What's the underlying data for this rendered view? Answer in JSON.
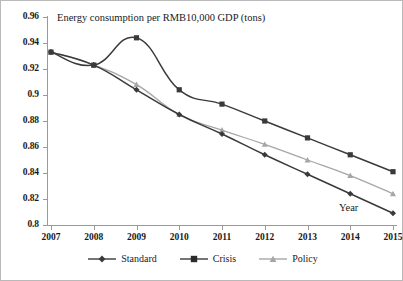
{
  "chart_data": {
    "type": "line",
    "title": "Energy consumption per RMB10,000 GDP (tons)",
    "xlabel": "Year",
    "ylabel": "",
    "categories": [
      "2007",
      "2008",
      "2009",
      "2010",
      "2011",
      "2012",
      "2013",
      "2014",
      "2015"
    ],
    "ylim": [
      0.8,
      0.96
    ],
    "yticks": [
      "0.96",
      "0.94",
      "0.92",
      "0.9",
      "0.88",
      "0.86",
      "0.84",
      "0.82",
      "0.8"
    ],
    "ytick_values": [
      0.96,
      0.94,
      0.92,
      0.9,
      0.88,
      0.86,
      0.84,
      0.82,
      0.8
    ],
    "grid": false,
    "legend_position": "bottom",
    "series": [
      {
        "name": "Standard",
        "marker": "diamond",
        "color": "#3a3a3a",
        "values": [
          0.933,
          0.923,
          0.904,
          0.885,
          0.87,
          0.854,
          0.839,
          0.824,
          0.809
        ]
      },
      {
        "name": "Crisis",
        "marker": "square",
        "color": "#3a3a3a",
        "values": [
          0.933,
          0.923,
          0.944,
          0.904,
          0.893,
          0.88,
          0.867,
          0.854,
          0.841
        ]
      },
      {
        "name": "Policy",
        "marker": "triangle",
        "color": "#a6a6a6",
        "values": [
          0.933,
          0.923,
          0.908,
          0.885,
          0.873,
          0.862,
          0.85,
          0.838,
          0.824
        ]
      }
    ]
  },
  "legend": {
    "items": [
      {
        "label": "Standard"
      },
      {
        "label": "Crisis"
      },
      {
        "label": "Policy"
      }
    ]
  }
}
